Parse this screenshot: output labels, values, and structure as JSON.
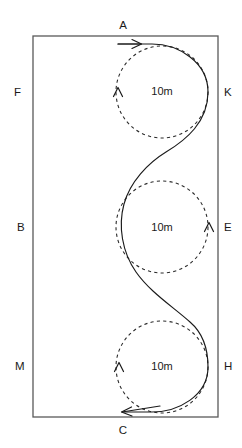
{
  "diagram": {
    "type": "driving-course-schematic",
    "arena": {
      "shape": "rectangle",
      "left": 33,
      "top": 36,
      "right": 218,
      "bottom": 417,
      "stroke_color": "#595959"
    },
    "corner_labels": [
      {
        "id": "A",
        "text": "A",
        "x": 123,
        "y": 26,
        "anchor": "middle",
        "side": "top"
      },
      {
        "id": "F",
        "text": "F",
        "x": 14,
        "y": 93,
        "anchor": "start",
        "side": "left"
      },
      {
        "id": "K",
        "text": "K",
        "x": 224,
        "y": 93,
        "anchor": "start",
        "side": "right"
      },
      {
        "id": "B",
        "text": "B",
        "x": 17,
        "y": 228,
        "anchor": "start",
        "side": "left"
      },
      {
        "id": "E",
        "text": "E",
        "x": 224,
        "y": 228,
        "anchor": "start",
        "side": "right"
      },
      {
        "id": "M",
        "text": "M",
        "x": 15,
        "y": 367,
        "anchor": "start",
        "side": "left"
      },
      {
        "id": "H",
        "text": "H",
        "x": 224,
        "y": 367,
        "anchor": "start",
        "side": "right"
      },
      {
        "id": "C",
        "text": "C",
        "x": 123,
        "y": 431,
        "anchor": "middle",
        "side": "bottom"
      }
    ],
    "circles": [
      {
        "id": "top",
        "label": "10m",
        "cx": 162,
        "cy": 92,
        "r": 46,
        "style": "dashed"
      },
      {
        "id": "middle",
        "label": "10m",
        "cx": 162,
        "cy": 227,
        "r": 46,
        "style": "dashed"
      },
      {
        "id": "bottom",
        "label": "10m",
        "cx": 162,
        "cy": 367,
        "r": 46,
        "style": "dashed"
      }
    ],
    "radius_labels": [
      {
        "text": "10m",
        "x": 162,
        "y": 92
      },
      {
        "text": "10m",
        "x": 162,
        "y": 228
      },
      {
        "text": "10m",
        "x": 162,
        "y": 367
      }
    ],
    "direction_arrows": [
      {
        "id": "entry",
        "direction": "right",
        "x": 140,
        "y": 44,
        "on": "top-rail"
      },
      {
        "id": "top-circle-turn",
        "direction": "up",
        "x": 118,
        "y": 91,
        "on": "top-circle-left"
      },
      {
        "id": "middle-circle-turn",
        "direction": "up",
        "x": 209,
        "y": 226,
        "on": "middle-circle-right"
      },
      {
        "id": "bottom-circle-turn",
        "direction": "up",
        "x": 119,
        "y": 366,
        "on": "bottom-circle-left"
      },
      {
        "id": "exit",
        "direction": "left",
        "x": 122,
        "y": 412,
        "on": "bottom-rail"
      }
    ],
    "colors": {
      "background": "#ffffff",
      "arena_stroke": "#595959",
      "dashed_stroke": "#2b2b2b",
      "track_stroke": "#1a1a1a",
      "text": "#1a1a1a"
    }
  }
}
